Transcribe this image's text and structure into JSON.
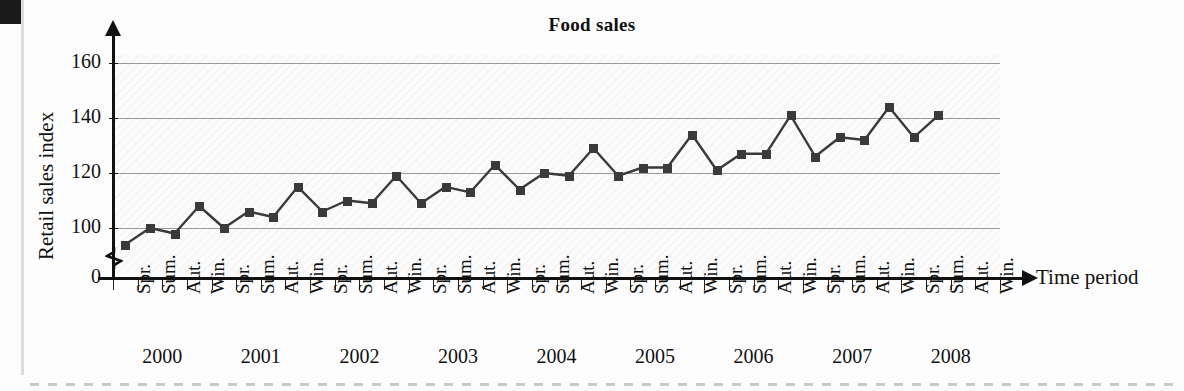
{
  "chart_data": {
    "type": "line",
    "title": "Food sales",
    "xlabel": "Time period",
    "ylabel": "Retail sales index",
    "ylim": [
      0,
      170
    ],
    "yticks": [
      0,
      100,
      120,
      140,
      160
    ],
    "y_axis_break": true,
    "grid": true,
    "legend": null,
    "marker": "square",
    "years": [
      "2000",
      "2001",
      "2002",
      "2003",
      "2004",
      "2005",
      "2006",
      "2007",
      "2008"
    ],
    "quarters": [
      "Spr.",
      "Sum.",
      "Aut.",
      "Win."
    ],
    "categories": [
      "2000 Spr.",
      "2000 Sum.",
      "2000 Aut.",
      "2000 Win.",
      "2001 Spr.",
      "2001 Sum.",
      "2001 Aut.",
      "2001 Win.",
      "2002 Spr.",
      "2002 Sum.",
      "2002 Aut.",
      "2002 Win.",
      "2003 Spr.",
      "2003 Sum.",
      "2003 Aut.",
      "2003 Win.",
      "2004 Spr.",
      "2004 Sum.",
      "2004 Aut.",
      "2004 Win.",
      "2005 Spr.",
      "2005 Sum.",
      "2005 Aut.",
      "2005 Win.",
      "2006 Spr.",
      "2006 Sum.",
      "2006 Aut.",
      "2006 Win.",
      "2007 Spr.",
      "2007 Sum.",
      "2007 Aut.",
      "2007 Win.",
      "2008 Spr.",
      "2008 Sum.",
      "2008 Aut.",
      "2008 Win."
    ],
    "values": [
      94,
      100,
      98,
      108,
      100,
      106,
      104,
      115,
      106,
      110,
      109,
      119,
      109,
      115,
      113,
      123,
      114,
      120,
      119,
      129,
      119,
      122,
      122,
      134,
      121,
      127,
      127,
      141,
      126,
      133,
      132,
      144,
      133,
      141,
      null,
      null
    ]
  },
  "axis": {
    "y_tick_labels": [
      "160",
      "140",
      "120",
      "100",
      "0"
    ],
    "x_time_label": "Time period"
  }
}
